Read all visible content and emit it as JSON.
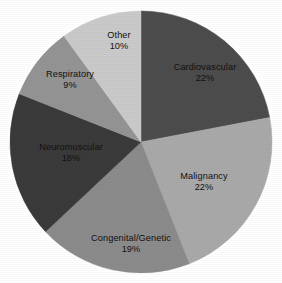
{
  "chart_data": {
    "type": "pie",
    "title": "",
    "subtitle": "",
    "xlabel": "",
    "ylabel": "",
    "legend_position": "none",
    "grid": false,
    "labels_inside_slices": true,
    "start_angle_deg": 0,
    "direction": "clockwise",
    "categories": [
      "Cardiovascular",
      "Malignancy",
      "Congenital/Genetic",
      "Neuromuscular",
      "Respiratory",
      "Other"
    ],
    "values": [
      22,
      22,
      19,
      18,
      9,
      10
    ],
    "value_labels": [
      "22%",
      "22%",
      "19%",
      "18%",
      "9%",
      "10%"
    ],
    "unit": "%",
    "total": 100,
    "colors": [
      "#4c4c4c",
      "#a9a9a9",
      "#8b8b8b",
      "#3a3a3a",
      "#949494",
      "#cacaca"
    ],
    "slices": [
      {
        "name": "Cardiovascular",
        "value": 22,
        "value_label": "22%",
        "color": "#4c4c4c",
        "start_deg": 0,
        "end_deg": 79.2,
        "label_x": 205,
        "label_y": 73
      },
      {
        "name": "Malignancy",
        "value": 22,
        "value_label": "22%",
        "color": "#a9a9a9",
        "start_deg": 79.2,
        "end_deg": 158.4,
        "label_x": 204,
        "label_y": 182
      },
      {
        "name": "Congenital/Genetic",
        "value": 19,
        "value_label": "19%",
        "color": "#8b8b8b",
        "start_deg": 158.4,
        "end_deg": 226.8,
        "label_x": 131,
        "label_y": 244
      },
      {
        "name": "Neuromuscular",
        "value": 18,
        "value_label": "18%",
        "color": "#3a3a3a",
        "start_deg": 226.8,
        "end_deg": 291.6,
        "label_x": 71,
        "label_y": 153
      },
      {
        "name": "Respiratory",
        "value": 9,
        "value_label": "9%",
        "color": "#949494",
        "start_deg": 291.6,
        "end_deg": 324.0,
        "label_x": 70,
        "label_y": 80
      },
      {
        "name": "Other",
        "value": 10,
        "value_label": "10%",
        "color": "#cacaca",
        "start_deg": 324.0,
        "end_deg": 360.0,
        "label_x": 119,
        "label_y": 41
      }
    ],
    "geometry": {
      "center_x": 141,
      "center_y": 142,
      "radius": 131
    },
    "background_color": "#ffffff",
    "label_text_color": "#111111"
  }
}
